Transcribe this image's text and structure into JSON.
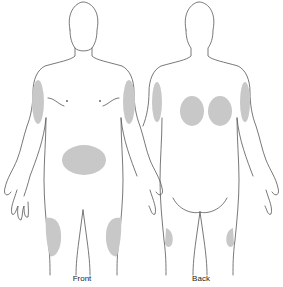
{
  "diagram": {
    "type": "injection-site-body-map",
    "figures": [
      {
        "id": "front",
        "label": "Front",
        "sites": [
          "left-upper-arm",
          "right-upper-arm",
          "abdomen",
          "left-thigh",
          "right-thigh"
        ]
      },
      {
        "id": "back",
        "label": "Back",
        "sites": [
          "left-upper-arm",
          "right-upper-arm",
          "left-upper-buttock-back",
          "right-upper-buttock-back",
          "left-thigh-back",
          "right-thigh-back"
        ]
      }
    ],
    "colors": {
      "outline": "#555555",
      "site_fill": "#c8c8c8",
      "background": "#ffffff"
    }
  }
}
